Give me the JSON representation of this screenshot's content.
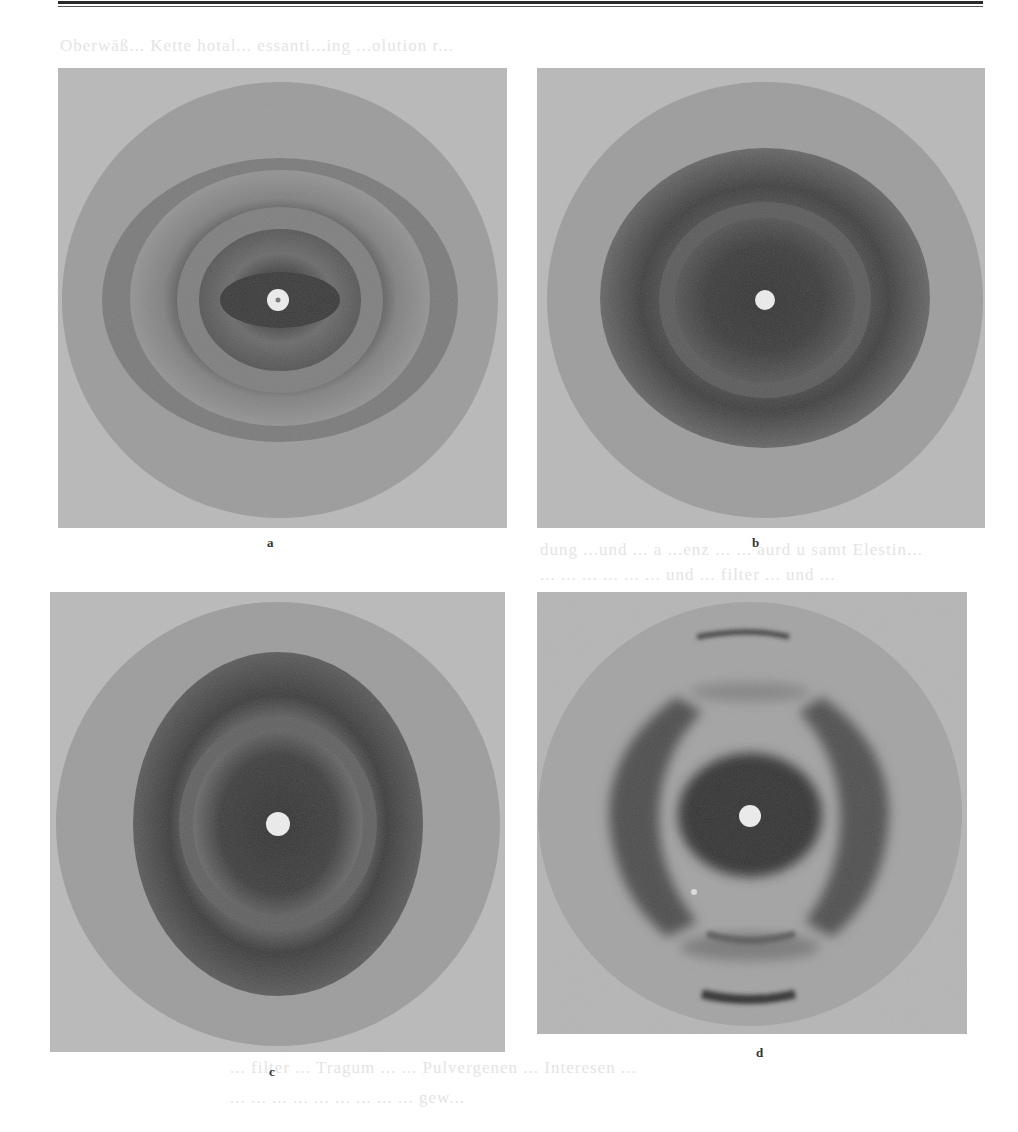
{
  "figure": {
    "panels": [
      {
        "id": "a",
        "label": "a"
      },
      {
        "id": "b",
        "label": "b"
      },
      {
        "id": "c",
        "label": "c"
      },
      {
        "id": "d",
        "label": "d"
      }
    ]
  },
  "show_through_text": {
    "line_top": "Oberwäß... Kette hotal... essanti...ing ...olution r...",
    "line_mid1": "dung ...und ... a ...enz ... ... aurd u samt Elestin...",
    "line_mid2": "... ... ... ... ... ... und ... filter ... und ...",
    "line_bottom1": "... filter ... Tragum ... ... Pulvergenen ... Interesen ...",
    "line_bottom2": "... ... ... ... ... ... ... ... ... gew..."
  }
}
